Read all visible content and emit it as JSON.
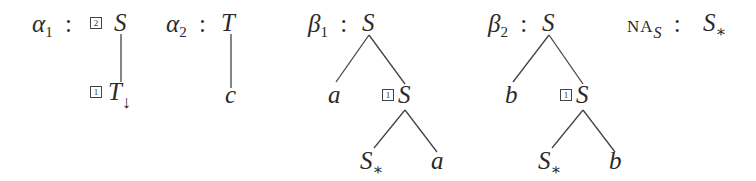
{
  "trees": {
    "alpha1": {
      "name": "α",
      "index": "1",
      "sep": ":",
      "root": {
        "label": "S",
        "address": "2"
      },
      "child": {
        "label": "T",
        "address": "1",
        "mark": "↓"
      }
    },
    "alpha2": {
      "name": "α",
      "index": "2",
      "sep": ":",
      "root": {
        "label": "T"
      },
      "child": {
        "label": "c"
      }
    },
    "beta1": {
      "name": "β",
      "index": "1",
      "sep": ":",
      "root": {
        "label": "S"
      },
      "left": {
        "label": "a"
      },
      "right": {
        "label": "S",
        "address": "1"
      },
      "rleft": {
        "label": "S",
        "mark": "∗"
      },
      "rright": {
        "label": "a"
      }
    },
    "beta2": {
      "name": "β",
      "index": "2",
      "sep": ":",
      "root": {
        "label": "S"
      },
      "left": {
        "label": "b"
      },
      "right": {
        "label": "S",
        "address": "1"
      },
      "rleft": {
        "label": "S",
        "mark": "∗"
      },
      "rright": {
        "label": "b"
      }
    },
    "na": {
      "name": "NA",
      "sub": "S",
      "sep": ":",
      "value": {
        "label": "S",
        "mark": "∗"
      }
    }
  }
}
